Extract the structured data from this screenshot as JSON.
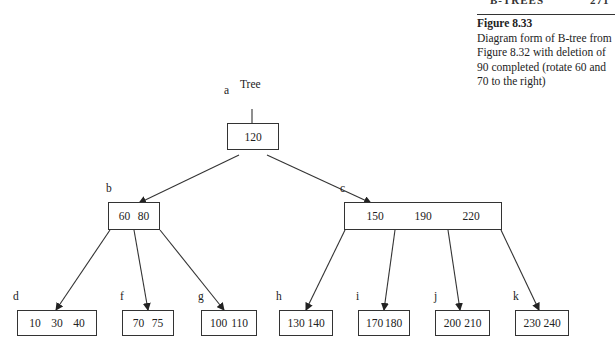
{
  "header": {
    "running_title": "B-TREES",
    "page_number": "271"
  },
  "caption": {
    "title": "Figure 8.33",
    "text": "Diagram form of B-tree from Figure 8.32 with deletion of 90 completed (rotate 60 and 70 to the right)"
  },
  "tree": {
    "pointer_label": "Tree",
    "nodes": [
      {
        "id": "a",
        "keys": [
          "120"
        ]
      },
      {
        "id": "b",
        "keys": [
          "60",
          "80"
        ]
      },
      {
        "id": "c",
        "keys": [
          "150",
          "190",
          "220"
        ]
      },
      {
        "id": "d",
        "keys": [
          "10",
          "30",
          "40"
        ]
      },
      {
        "id": "f",
        "keys": [
          "70",
          "75"
        ]
      },
      {
        "id": "g",
        "keys": [
          "100",
          "110"
        ]
      },
      {
        "id": "h",
        "keys": [
          "130",
          "140"
        ]
      },
      {
        "id": "i",
        "keys": [
          "170",
          "180"
        ]
      },
      {
        "id": "j",
        "keys": [
          "200",
          "210"
        ]
      },
      {
        "id": "k",
        "keys": [
          "230",
          "240"
        ]
      }
    ],
    "edges": [
      [
        "a",
        "b"
      ],
      [
        "a",
        "c"
      ],
      [
        "b",
        "d"
      ],
      [
        "b",
        "f"
      ],
      [
        "b",
        "g"
      ],
      [
        "c",
        "h"
      ],
      [
        "c",
        "i"
      ],
      [
        "c",
        "j"
      ],
      [
        "c",
        "k"
      ]
    ]
  }
}
